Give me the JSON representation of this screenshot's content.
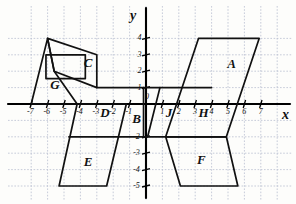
{
  "figure": {
    "type": "coordinate-grid-diagram",
    "background_color": "#fdfdfb",
    "grid_color": "#b9bfd0",
    "ink_color": "#111111",
    "axis_color": "#000000"
  },
  "geometry": {
    "origin_px": {
      "x": 146,
      "y": 104
    },
    "unit_px": 16.4,
    "x_range": [
      -7.9,
      8.2
    ],
    "y_range": [
      -5.9,
      4.6
    ]
  },
  "axes": {
    "x_axis_label": "x",
    "y_axis_label": "y",
    "x_ticks": [
      {
        "value": -7,
        "label": "-7"
      },
      {
        "value": -6,
        "label": "-6"
      },
      {
        "value": -5,
        "label": "-5"
      },
      {
        "value": -4,
        "label": "-4"
      },
      {
        "value": -3,
        "label": "-3"
      },
      {
        "value": -2,
        "label": "-2"
      },
      {
        "value": -1,
        "label": "-1"
      },
      {
        "value": 0,
        "label": "0"
      },
      {
        "value": 1,
        "label": "1"
      },
      {
        "value": 2,
        "label": "2"
      },
      {
        "value": 3,
        "label": "3"
      },
      {
        "value": 4,
        "label": "4"
      },
      {
        "value": 5,
        "label": "5"
      },
      {
        "value": 6,
        "label": "6"
      },
      {
        "value": 7,
        "label": "7"
      }
    ],
    "y_ticks": [
      {
        "value": 4,
        "label": "4"
      },
      {
        "value": 3,
        "label": "3"
      },
      {
        "value": 2,
        "label": "2"
      },
      {
        "value": 1,
        "label": "1"
      },
      {
        "value": 0,
        "label": "0"
      },
      {
        "value": -2,
        "label": "-2"
      },
      {
        "value": -3,
        "label": "-3"
      },
      {
        "value": -4,
        "label": "-4"
      },
      {
        "value": -5,
        "label": "-5"
      }
    ]
  },
  "shapes": [
    {
      "id": "A",
      "name": "parallelogram-a",
      "label": "A",
      "label_at": {
        "x": 5.2,
        "y": 2.4
      },
      "vertices": [
        [
          3.2,
          4.0
        ],
        [
          6.9,
          4.0
        ],
        [
          4.9,
          -2.0
        ],
        [
          1.2,
          -2.0
        ]
      ]
    },
    {
      "id": "C",
      "name": "quadrilateral-c",
      "label": "C",
      "label_at": {
        "x": -3.55,
        "y": 2.45
      },
      "vertices": [
        [
          -6.0,
          4.0
        ],
        [
          -3.0,
          3.0
        ],
        [
          -3.0,
          1.0
        ],
        [
          -5.6,
          2.0
        ]
      ]
    },
    {
      "id": "G",
      "name": "quadrilateral-g",
      "label": "G",
      "label_at": {
        "x": -5.6,
        "y": 1.1
      },
      "vertices": [
        [
          -6.0,
          4.0
        ],
        [
          -7.0,
          0.0
        ],
        [
          -4.2,
          0.0
        ],
        [
          -5.6,
          2.0
        ]
      ]
    },
    {
      "id": "G2",
      "name": "inner-rectangle-g",
      "label": "",
      "label_at": null,
      "vertices": [
        [
          -6.1,
          3.0
        ],
        [
          -3.7,
          3.0
        ],
        [
          -3.7,
          1.55
        ],
        [
          -6.1,
          1.55
        ]
      ]
    },
    {
      "id": "E",
      "name": "parallelogram-e",
      "label": "E",
      "label_at": {
        "x": -3.55,
        "y": -3.6
      },
      "vertices": [
        [
          -4.2,
          0.0
        ],
        [
          -1.2,
          0.0
        ],
        [
          -2.4,
          -5.0
        ],
        [
          -5.3,
          -5.0
        ]
      ]
    },
    {
      "id": "F",
      "name": "trapezoid-f",
      "label": "F",
      "label_at": {
        "x": 3.35,
        "y": -3.45
      },
      "vertices": [
        [
          1.2,
          -2.0
        ],
        [
          4.9,
          -2.0
        ],
        [
          5.6,
          -5.0
        ],
        [
          2.1,
          -5.0
        ]
      ]
    },
    {
      "id": "B",
      "name": "sliver-b",
      "label": "B",
      "label_at": {
        "x": -0.6,
        "y": -0.95
      },
      "vertices": [
        [
          -0.15,
          1.0
        ],
        [
          0.85,
          1.0
        ],
        [
          0.1,
          -2.0
        ],
        [
          -0.15,
          -2.0
        ]
      ]
    }
  ],
  "segments": [
    {
      "name": "horizontal-y1-left",
      "from": [
        -3.0,
        1.0
      ],
      "to": [
        -0.15,
        1.0
      ]
    },
    {
      "name": "horizontal-y1-right",
      "from": [
        0.85,
        1.0
      ],
      "to": [
        4.0,
        1.0
      ]
    },
    {
      "name": "horizontal-ym2-left",
      "from": [
        -4.7,
        -2.0
      ],
      "to": [
        -0.15,
        -2.0
      ]
    },
    {
      "name": "horizontal-ym2-right",
      "from": [
        0.1,
        -2.0
      ],
      "to": [
        1.2,
        -2.0
      ]
    }
  ],
  "shape_labels": {
    "on_x_axis": [
      {
        "text": "D",
        "x": -2.55,
        "y": -0.55
      },
      {
        "text": "J",
        "x": 1.45,
        "y": -0.55
      },
      {
        "text": "H",
        "x": 3.45,
        "y": -0.55
      }
    ]
  }
}
